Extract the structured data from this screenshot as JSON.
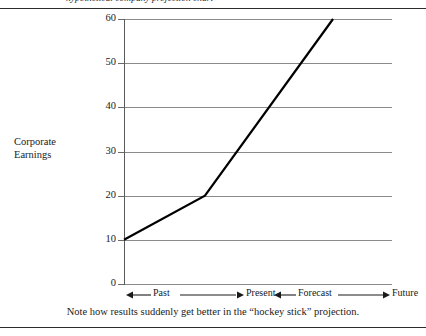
{
  "page": {
    "clipped_heading": "hypothetical company projection chart",
    "caption": "Note how results suddenly get better in the “hockey stick” projection."
  },
  "chart_data": {
    "type": "line",
    "title": "",
    "xlabel": "",
    "ylabel": "Corporate Earnings",
    "ylim": [
      0,
      60
    ],
    "yticks": [
      0,
      10,
      20,
      30,
      40,
      50,
      60
    ],
    "ytick_labels": [
      "0",
      "10",
      "20",
      "30",
      "40",
      "50",
      "60"
    ],
    "grid": true,
    "legend": "none",
    "x_segments": [
      {
        "label": "Past",
        "arrow": "left"
      },
      {
        "label": "Present",
        "arrow": "right"
      },
      {
        "label": "Forecast",
        "arrow": "left"
      },
      {
        "label": "Future",
        "arrow": "right"
      }
    ],
    "series": [
      {
        "name": "Corporate Earnings",
        "x": [
          0,
          0.302,
          0.78
        ],
        "values": [
          10,
          20,
          60
        ],
        "color": "#000000"
      }
    ],
    "annotations": []
  },
  "axis_label": {
    "line1": "Corporate",
    "line2": "Earnings"
  }
}
